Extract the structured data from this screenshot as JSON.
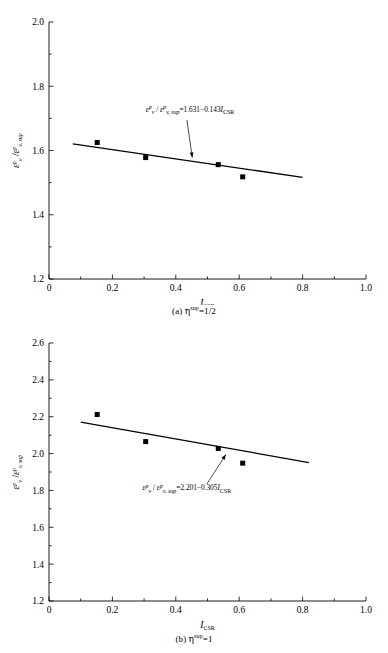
{
  "figure": {
    "panels": [
      {
        "id": "a",
        "caption_prefix": "(a) ",
        "caption_symbol": "η",
        "caption_sup": "sup",
        "caption_suffix": "=1/2",
        "equation": {
          "num": "ε",
          "num_sup": "p",
          "num_sub": "v",
          "den": "ε",
          "den_sup": "p",
          "den_sub": "v, sup",
          "rhs": "=1.631−0.143",
          "rhs_var": "I",
          "rhs_var_sub": "CSR",
          "text": "εvᵖ/εv,supᵖ=1.631−0.143ICSR"
        }
      },
      {
        "id": "b",
        "caption_prefix": "(b) ",
        "caption_symbol": "η",
        "caption_sup": "sup",
        "caption_suffix": "=1",
        "equation": {
          "num": "ε",
          "num_sup": "p",
          "num_sub": "v",
          "den": "ε",
          "den_sup": "p",
          "den_sub": "v, sup",
          "rhs": "=2.201−0.305",
          "rhs_var": "I",
          "rhs_var_sub": "CSR",
          "text": "εvᵖ/εv,supᵖ=2.201−0.305ICSR"
        }
      }
    ]
  },
  "chart_data": [
    {
      "type": "scatter",
      "panel": "a",
      "title": "",
      "xlabel": "I",
      "xlabel_sub": "CSR",
      "ylabel": "ε",
      "ylabel_sup": "p",
      "ylabel_sub": "v",
      "ylabel_den": "ε",
      "ylabel_den_sup": "p",
      "ylabel_den_sub": "v, sup",
      "xlim": [
        0,
        1.0
      ],
      "ylim": [
        1.2,
        2.0
      ],
      "xticks": [
        0,
        0.2,
        0.4,
        0.6,
        0.8,
        1.0
      ],
      "xtick_labels": [
        "0",
        "0.2",
        "0.4",
        "0.6",
        "0.8",
        "1.0"
      ],
      "yticks": [
        1.2,
        1.4,
        1.6,
        1.8,
        2.0
      ],
      "ytick_labels": [
        "1.2",
        "1.4",
        "1.6",
        "1.8",
        "2.0"
      ],
      "xminor_step": 0.1,
      "yminor_step": 0.1,
      "grid": false,
      "legend": "none",
      "marker": "square",
      "marker_color": "#000000",
      "line_color": "#000000",
      "points": [
        {
          "x": 0.152,
          "y": 1.625
        },
        {
          "x": 0.305,
          "y": 1.578
        },
        {
          "x": 0.534,
          "y": 1.556
        },
        {
          "x": 0.611,
          "y": 1.518
        }
      ],
      "fit": {
        "intercept": 1.631,
        "slope": -0.143,
        "x_start": 0.075,
        "x_end": 0.8
      },
      "annotation": {
        "text": "εvᵖ/εv,supᵖ=1.631−0.143ICSR",
        "x": 0.445,
        "y": 1.72,
        "arrow_from_x": 0.435,
        "arrow_from_y": 1.695,
        "arrow_to_x": 0.452,
        "arrow_to_y": 1.578
      }
    },
    {
      "type": "scatter",
      "panel": "b",
      "title": "",
      "xlabel": "I",
      "xlabel_sub": "CSR",
      "ylabel": "ε",
      "ylabel_sup": "p",
      "ylabel_sub": "v",
      "ylabel_den": "ε",
      "ylabel_den_sup": "p",
      "ylabel_den_sub": "v, sup",
      "xlim": [
        0,
        1.0
      ],
      "ylim": [
        1.2,
        2.6
      ],
      "xticks": [
        0,
        0.2,
        0.4,
        0.6,
        0.8,
        1.0
      ],
      "xtick_labels": [
        "0",
        "0.2",
        "0.4",
        "0.6",
        "0.8",
        "1.0"
      ],
      "yticks": [
        1.2,
        1.4,
        1.6,
        1.8,
        2.0,
        2.2,
        2.4,
        2.6
      ],
      "ytick_labels": [
        "1.2",
        "1.4",
        "1.6",
        "1.8",
        "2.0",
        "2.2",
        "2.4",
        "2.6"
      ],
      "xminor_step": 0.1,
      "yminor_step": 0.1,
      "grid": false,
      "legend": "none",
      "marker": "square",
      "marker_color": "#000000",
      "line_color": "#000000",
      "points": [
        {
          "x": 0.152,
          "y": 2.212
        },
        {
          "x": 0.305,
          "y": 2.065
        },
        {
          "x": 0.534,
          "y": 2.028
        },
        {
          "x": 0.611,
          "y": 1.948
        }
      ],
      "fit": {
        "intercept": 2.201,
        "slope": -0.305,
        "x_start": 0.1,
        "x_end": 0.82
      },
      "annotation": {
        "text": "εvᵖ/εv,supᵖ=2.201−0.305ICSR",
        "x": 0.435,
        "y": 1.8,
        "arrow_from_x": 0.498,
        "arrow_from_y": 1.835,
        "arrow_to_x": 0.558,
        "arrow_to_y": 1.995
      }
    }
  ]
}
